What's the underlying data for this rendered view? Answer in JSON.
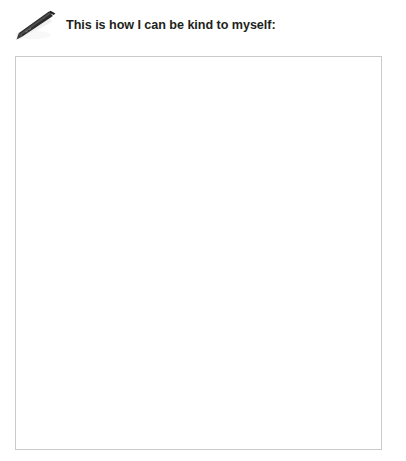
{
  "page": {
    "background_color": "#ffffff",
    "width": 406,
    "height": 461
  },
  "header": {
    "icon": {
      "name": "pen-icon",
      "description": "dark ballpoint pen angled from lower-left to upper-right with soft drop shadow",
      "body_color": "#2b2b2b",
      "tip_color": "#4a4a4a",
      "shadow_color": "#d9d9d9"
    },
    "title": "This is how I can be kind to myself:",
    "title_color": "#231f20"
  },
  "answer_area": {
    "name": "answer-box",
    "placeholder": "",
    "value": "",
    "border_color": "#c9cacb",
    "fill_color": "#ffffff"
  }
}
